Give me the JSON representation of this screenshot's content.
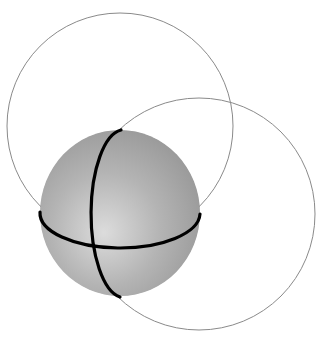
{
  "diagram": {
    "colors": {
      "background": "#ffffff",
      "sphere_highlight": "#dcdcdc",
      "sphere_mid": "#b4b4b4",
      "sphere_edge": "#9a9a9a",
      "thin_circle_stroke": "#8a8a8a",
      "thick_arc_stroke": "#000000"
    },
    "sphere": {
      "cx": 120,
      "cy": 213,
      "rx": 80,
      "ry": 83
    },
    "circles": [
      {
        "name": "upper-left-circle",
        "cx": 120,
        "cy": 126,
        "r": 113
      },
      {
        "name": "lower-right-circle",
        "cx": 199,
        "cy": 214,
        "r": 116
      }
    ],
    "arcs": [
      {
        "name": "horizontal-arc",
        "path": "M40,212 A80,35 0 0 0 200,214"
      },
      {
        "name": "vertical-arc",
        "path": "M121,130 A33,84 0 0 0 120,297"
      }
    ]
  }
}
